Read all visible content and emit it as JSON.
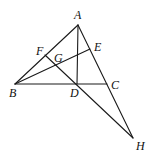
{
  "diagram": {
    "type": "geometry",
    "points": {
      "A": {
        "x": 78,
        "y": 25,
        "label": "A",
        "lx": 74,
        "ly": 19
      },
      "B": {
        "x": 15,
        "y": 84,
        "label": "B",
        "lx": 9,
        "ly": 97
      },
      "C": {
        "x": 107,
        "y": 84,
        "label": "C",
        "lx": 111,
        "ly": 89
      },
      "D": {
        "x": 77,
        "y": 84,
        "label": "D",
        "lx": 70,
        "ly": 97
      },
      "E": {
        "x": 90,
        "y": 49,
        "label": "E",
        "lx": 94,
        "ly": 51
      },
      "F": {
        "x": 45,
        "y": 55,
        "label": "F",
        "lx": 36,
        "ly": 55
      },
      "G": {
        "x": 57,
        "y": 63,
        "label": "G",
        "lx": 54,
        "ly": 62
      },
      "H": {
        "x": 133,
        "y": 138,
        "label": "H",
        "lx": 136,
        "ly": 150
      }
    },
    "segments": [
      [
        "A",
        "B"
      ],
      [
        "B",
        "C"
      ],
      [
        "A",
        "H"
      ],
      [
        "A",
        "D"
      ],
      [
        "B",
        "E"
      ],
      [
        "F",
        "H"
      ]
    ],
    "labels": [
      "A",
      "B",
      "C",
      "D",
      "E",
      "F",
      "G",
      "H"
    ]
  }
}
